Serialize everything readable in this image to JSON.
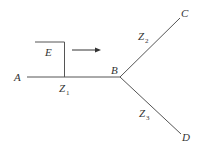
{
  "diagram": {
    "type": "transmission-line-network",
    "line_color": "#555555",
    "nodes": {
      "A": {
        "label": "A"
      },
      "B": {
        "label": "B"
      },
      "C": {
        "label": "C"
      },
      "D": {
        "label": "D"
      }
    },
    "source": {
      "label": "E"
    },
    "impedances": {
      "z1": {
        "main": "Z",
        "sub": "1"
      },
      "z2": {
        "main": "Z",
        "sub": "2"
      },
      "z3": {
        "main": "Z",
        "sub": "3"
      }
    },
    "arrow": {
      "direction": "right"
    }
  }
}
